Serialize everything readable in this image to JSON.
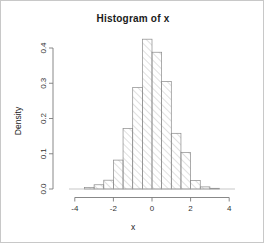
{
  "plot": {
    "title": "Histogram of x",
    "xlabel": "x",
    "ylabel": "Density",
    "frame_color": "#c8c8c8",
    "axis_color": "#7a7a7a",
    "bar_border_color": "#8a8a8a",
    "hatch_color": "#9a9a9a"
  },
  "chart_data": {
    "type": "bar",
    "title": "Histogram of x",
    "xlabel": "x",
    "ylabel": "Density",
    "xlim": [
      -4.2,
      4.2
    ],
    "ylim": [
      0,
      0.44
    ],
    "xticks": [
      -4,
      -2,
      0,
      2,
      4
    ],
    "xtick_labels": [
      "-4",
      "-2",
      "0",
      "2",
      "4"
    ],
    "yticks": [
      0.0,
      0.1,
      0.2,
      0.3,
      0.4
    ],
    "ytick_labels": [
      "0.0",
      "0.1",
      "0.2",
      "0.3",
      "0.4"
    ],
    "grid": false,
    "legend": false,
    "bin_width": 0.5,
    "bin_edges": [
      -3.5,
      -3.0,
      -2.5,
      -2.0,
      -1.5,
      -1.0,
      -0.5,
      0.0,
      0.5,
      1.0,
      1.5,
      2.0,
      2.5,
      3.0,
      3.5
    ],
    "bin_centers": [
      -3.25,
      -2.75,
      -2.25,
      -1.75,
      -1.25,
      -0.75,
      -0.25,
      0.25,
      0.75,
      1.25,
      1.75,
      2.25,
      2.75,
      3.25
    ],
    "values": [
      0.004,
      0.012,
      0.025,
      0.082,
      0.172,
      0.288,
      0.425,
      0.388,
      0.305,
      0.158,
      0.104,
      0.024,
      0.006,
      0.002
    ],
    "series": [
      {
        "name": "Density",
        "values": [
          0.004,
          0.012,
          0.025,
          0.082,
          0.172,
          0.288,
          0.425,
          0.388,
          0.305,
          0.158,
          0.104,
          0.024,
          0.006,
          0.002
        ]
      }
    ]
  }
}
